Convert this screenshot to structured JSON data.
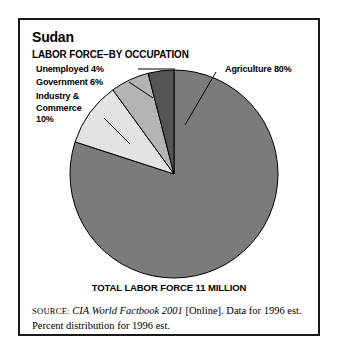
{
  "figure": {
    "country": "Sudan",
    "subtitle": "LABOR FORCE–BY OCCUPATION",
    "total_caption": "TOTAL LABOR FORCE 11 MILLION"
  },
  "labels": {
    "unemployed": "Unemployed 4%",
    "government": "Government 6%",
    "industry_line1": "Industry &",
    "industry_line2": "Commerce",
    "industry_line3": "10%",
    "agriculture": "Agriculture 80%"
  },
  "source": {
    "prefix": "SOURCE:",
    "title": "CIA World Factbook 2001",
    "rest": " [Online]. Data for 1996 est.",
    "line2": "Percent distribution for 1996 est."
  },
  "chart_data": {
    "type": "pie",
    "subtitle": "LABOR FORCE–BY OCCUPATION",
    "total_label": "TOTAL LABOR FORCE 11 MILLION",
    "total_value": 11,
    "total_units": "million workers",
    "unit": "percent",
    "start_angle_deg": 0,
    "direction": "clockwise",
    "legend": "leader-line labels",
    "categories": [
      "Agriculture",
      "Industry & Commerce",
      "Government",
      "Unemployed"
    ],
    "values": [
      80,
      10,
      6,
      4
    ],
    "colors": [
      "#7b7b7b",
      "#e3e3e3",
      "#b4b4b4",
      "#555555"
    ],
    "slices": [
      {
        "name": "Agriculture",
        "value": 80,
        "label": "Agriculture 80%",
        "color": "#7b7b7b"
      },
      {
        "name": "Industry & Commerce",
        "value": 10,
        "label": "Industry & Commerce 10%",
        "color": "#e3e3e3"
      },
      {
        "name": "Government",
        "value": 6,
        "label": "Government 6%",
        "color": "#b4b4b4"
      },
      {
        "name": "Unemployed",
        "value": 4,
        "label": "Unemployed 4%",
        "color": "#555555"
      }
    ]
  }
}
